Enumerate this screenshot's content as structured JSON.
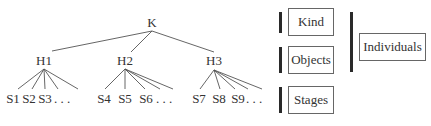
{
  "tree": {
    "root": {
      "label": "K",
      "x": 152,
      "y": 23
    },
    "hubs": [
      {
        "label": "H1",
        "x": 44,
        "y": 61,
        "branch": [
          44,
          69
        ],
        "leaves": [
          {
            "label": "S1",
            "x": 13
          },
          {
            "label": "S2",
            "x": 29
          },
          {
            "label": "S3",
            "x": 45
          },
          {
            "label": ". . .",
            "x": 62
          }
        ],
        "extra_edges": [
          78
        ]
      },
      {
        "label": "H2",
        "x": 125,
        "y": 61,
        "branch": [
          125,
          69
        ],
        "leaves": [
          {
            "label": "S4",
            "x": 104
          },
          {
            "label": "S5",
            "x": 125
          },
          {
            "label": "S6",
            "x": 146
          },
          {
            "label": ". . .",
            "x": 164
          }
        ],
        "extra_edges": [
          172
        ]
      },
      {
        "label": "H3",
        "x": 214,
        "y": 61,
        "branch": [
          214,
          70
        ],
        "leaves": [
          {
            "label": "S7",
            "x": 199
          },
          {
            "label": "S8",
            "x": 219
          },
          {
            "label": "S9",
            "x": 238
          },
          {
            "label": ". . .",
            "x": 254
          }
        ],
        "extra_edges": [
          260
        ]
      }
    ],
    "root_edges_end": [
      [
        52,
        51
      ],
      [
        131,
        52
      ],
      [
        214,
        52
      ]
    ]
  },
  "legend": {
    "levels": [
      {
        "label": "Kind"
      },
      {
        "label": "Objects"
      },
      {
        "label": "Stages"
      }
    ],
    "group": {
      "label": "Individuals"
    }
  }
}
